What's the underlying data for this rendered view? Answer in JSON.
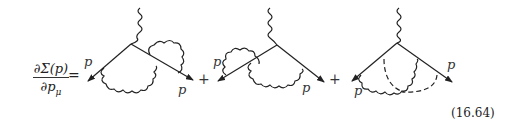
{
  "equation": {
    "lhs_numerator": "∂Σ(p)",
    "lhs_denominator": "∂p",
    "lhs_denominator_sub": "μ",
    "equals": "=",
    "number": "(16.64)"
  },
  "diagrams": [
    {
      "id": 1,
      "description": "vertex with photon self-energy loop on outgoing leg and vertex-correction photon",
      "labels": [
        "p",
        "p"
      ]
    },
    {
      "id": 2,
      "description": "vertex with photon self-energy loop on incoming leg and vertex-correction photon",
      "labels": [
        "p",
        "p"
      ]
    },
    {
      "id": 3,
      "description": "vertex with crossed photon and two dashed lines",
      "labels": [
        "p",
        "p"
      ]
    }
  ],
  "operators": [
    "+",
    "+"
  ],
  "label_p": "p"
}
